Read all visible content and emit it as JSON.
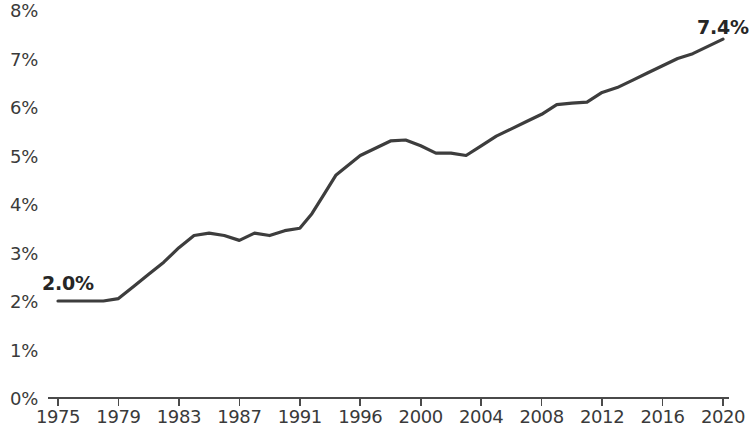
{
  "chart_data": {
    "type": "line",
    "title": "",
    "subtitle": "",
    "xlabel": "",
    "ylabel": "",
    "grid": false,
    "legend": null,
    "xlim": [
      1975,
      2020
    ],
    "ylim": [
      0,
      8
    ],
    "y_tick_labels": [
      "8%",
      "7%",
      "6%",
      "5%",
      "4%",
      "3%",
      "2%",
      "1%",
      "0%"
    ],
    "y_tick_values": [
      8,
      7,
      6,
      5,
      4,
      3,
      2,
      1,
      0
    ],
    "x_tick_labels": [
      "1975",
      "1979",
      "1983",
      "1987",
      "1991",
      "1996",
      "2000",
      "2004",
      "2008",
      "2012",
      "2016",
      "2020"
    ],
    "x_tick_values": [
      1975,
      1979,
      1983,
      1987,
      1991,
      1996,
      2000,
      2004,
      2008,
      2012,
      2016,
      2020
    ],
    "annotations": [
      {
        "text": "2.0%",
        "x": 1975,
        "y": 2.0,
        "position": "above-left"
      },
      {
        "text": "7.4%",
        "x": 2020,
        "y": 7.4,
        "position": "above-right"
      }
    ],
    "line_color": "#3d3d3d",
    "series": [
      {
        "name": "value",
        "x": [
          1975,
          1976,
          1977,
          1978,
          1979,
          1980,
          1981,
          1982,
          1983,
          1984,
          1985,
          1986,
          1987,
          1988,
          1989,
          1990,
          1991,
          1992,
          1993,
          1994,
          1995,
          1996,
          1997,
          1998,
          1999,
          2000,
          2001,
          2002,
          2003,
          2004,
          2005,
          2006,
          2007,
          2008,
          2009,
          2010,
          2011,
          2012,
          2013,
          2014,
          2015,
          2016,
          2017,
          2018,
          2019,
          2020
        ],
        "values": [
          2.0,
          2.0,
          2.0,
          2.0,
          2.05,
          2.3,
          2.55,
          2.8,
          3.1,
          3.35,
          3.4,
          3.35,
          3.25,
          3.4,
          3.35,
          3.45,
          3.5,
          3.8,
          4.2,
          4.6,
          4.8,
          5.0,
          5.15,
          5.3,
          5.32,
          5.2,
          5.05,
          5.05,
          5.0,
          5.2,
          5.4,
          5.55,
          5.7,
          5.85,
          6.05,
          6.08,
          6.1,
          6.3,
          6.4,
          6.55,
          6.7,
          6.85,
          7.0,
          7.1,
          7.25,
          7.4
        ]
      }
    ]
  }
}
